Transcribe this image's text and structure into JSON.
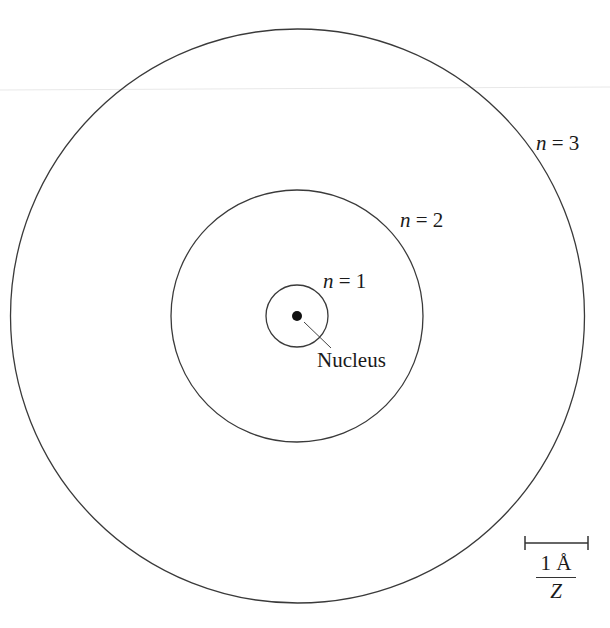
{
  "diagram": {
    "type": "bohr-model-orbits",
    "center": {
      "x": 297,
      "y": 316
    },
    "nucleus": {
      "label": "Nucleus",
      "radius_px": 5
    },
    "orbits": [
      {
        "n": "1",
        "var": "n",
        "eq": " = ",
        "label": "n = 1",
        "radius_px": 31
      },
      {
        "n": "2",
        "var": "n",
        "eq": " = ",
        "label": "n = 2",
        "radius_px": 126
      },
      {
        "n": "3",
        "var": "n",
        "eq": " = ",
        "label": "n = 3",
        "radius_px": 287
      }
    ],
    "scale_bar": {
      "numerator": "1 Å",
      "denominator": "Z",
      "label": "1 Å / Z"
    },
    "colors": {
      "stroke": "#333333",
      "background": "#ffffff",
      "artifact_line": "#e6e6e6"
    }
  }
}
